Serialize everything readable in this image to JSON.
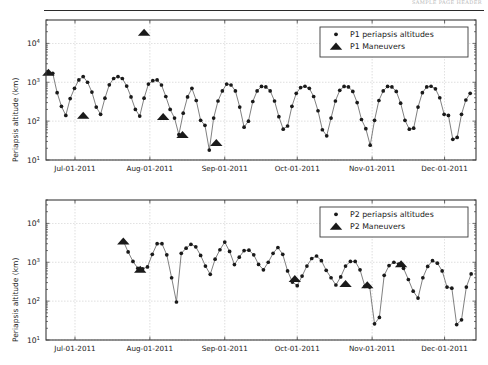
{
  "page": {
    "header_text": "SAMPLE PAGE HEADER",
    "background_color": "#ffffff",
    "marker_color": "#1a1a1a",
    "line_color": "#555555",
    "grid_color": "#c8c8c8",
    "axis_color": "#3a3a3a"
  },
  "chart_data": [
    {
      "type": "line",
      "id": "p1-periapsis-altitudes",
      "title": "",
      "xlabel": "",
      "ylabel": "Periapsis altitude (km)",
      "yscale": "log",
      "ylim": [
        10,
        40000
      ],
      "ytick_labels": [
        "10^1",
        "10^2",
        "10^3",
        "10^4"
      ],
      "ytick_values": [
        10,
        100,
        1000,
        10000
      ],
      "xtick_labels": [
        "Jul-01-2011",
        "Aug-01-2011",
        "Sep-01-2011",
        "Oct-01-2011",
        "Nov-01-2011",
        "Dec-01-2011"
      ],
      "xtick_days": [
        0,
        31,
        62,
        92,
        123,
        153
      ],
      "xlim_days": [
        -12,
        166
      ],
      "grid": true,
      "legend_position": "upper right",
      "legend": [
        {
          "label": "P1 periapsis altitudes",
          "marker": "dot"
        },
        {
          "label": "P1 Maneuvers",
          "marker": "triangle"
        }
      ],
      "series": [
        {
          "name": "P1 periapsis altitudes",
          "marker": "dot",
          "x": [
            -11,
            -9.2,
            -7.4,
            -5.6,
            -3.8,
            -2,
            -0.2,
            1.6,
            3.4,
            5.2,
            7,
            8.8,
            10.6,
            12.4,
            14.2,
            16,
            17.8,
            19.6,
            21.4,
            23.2,
            25,
            26.8,
            28.6,
            30.4,
            32.2,
            34,
            35.8,
            37.6,
            39.4,
            41.2,
            43,
            44.8,
            46.6,
            48.4,
            50.2,
            52,
            53.8,
            55.6,
            57.4,
            59.2,
            61,
            62.8,
            64.6,
            66.4,
            68.2,
            70,
            71.8,
            73.6,
            75.4,
            77.2,
            79,
            80.8,
            82.6,
            84.4,
            86.2,
            88,
            89.8,
            91.6,
            93.4,
            95.2,
            97,
            98.8,
            100.6,
            102.4,
            104.2,
            106,
            107.8,
            109.6,
            111.4,
            113.2,
            115,
            116.8,
            118.6,
            120.4,
            122.2,
            124,
            125.8,
            127.6,
            129.4,
            131.2,
            133,
            134.8,
            136.6,
            138.4,
            140.2,
            142,
            143.8,
            145.6,
            147.4,
            149.2,
            151,
            152.8,
            154.6,
            156.4,
            158.2,
            160,
            161.8,
            163.6
          ],
          "y": [
            1750,
            1700,
            540,
            240,
            140,
            380,
            700,
            1150,
            1400,
            1000,
            560,
            230,
            150,
            390,
            860,
            1250,
            1400,
            1250,
            800,
            420,
            200,
            135,
            390,
            900,
            1100,
            1150,
            850,
            430,
            200,
            120,
            45,
            160,
            420,
            700,
            340,
            105,
            78,
            18,
            120,
            330,
            600,
            900,
            850,
            600,
            230,
            70,
            100,
            320,
            600,
            780,
            760,
            600,
            330,
            130,
            62,
            75,
            240,
            520,
            730,
            790,
            700,
            430,
            185,
            60,
            42,
            120,
            330,
            620,
            780,
            760,
            580,
            300,
            110,
            64,
            24,
            105,
            340,
            600,
            780,
            760,
            580,
            290,
            105,
            62,
            66,
            230,
            540,
            760,
            790,
            680,
            400,
            150,
            140,
            34,
            38,
            150,
            350,
            520
          ]
        }
      ],
      "maneuvers": {
        "name": "P1 Maneuvers",
        "marker": "triangle",
        "x": [
          -11,
          3.4,
          28.6,
          36.5,
          44.5,
          58.5
        ],
        "y": [
          1800,
          140,
          19000,
          130,
          45,
          28
        ]
      }
    },
    {
      "type": "line",
      "id": "p2-periapsis-altitudes",
      "title": "",
      "xlabel": "",
      "ylabel": "Periapsis altitude (km)",
      "yscale": "log",
      "ylim": [
        10,
        40000
      ],
      "ytick_labels": [
        "10^1",
        "10^2",
        "10^3",
        "10^4"
      ],
      "ytick_values": [
        10,
        100,
        1000,
        10000
      ],
      "xtick_labels": [
        "Jul-01-2011",
        "Aug-01-2011",
        "Sep-01-2011",
        "Oct-01-2011",
        "Nov-01-2011",
        "Dec-01-2011"
      ],
      "xtick_days": [
        0,
        31,
        62,
        92,
        123,
        153
      ],
      "xlim_days": [
        -12,
        166
      ],
      "grid": true,
      "legend_position": "upper right",
      "legend": [
        {
          "label": "P2 periapsis altitudes",
          "marker": "dot"
        },
        {
          "label": "P2 Maneuvers",
          "marker": "triangle"
        }
      ],
      "series": [
        {
          "name": "P2 periapsis altitudes",
          "marker": "dot",
          "x": [
            20,
            22,
            24,
            26,
            28,
            30,
            32,
            34,
            36,
            38,
            40,
            42,
            44,
            46,
            48,
            50,
            52,
            54,
            56,
            58,
            60,
            62,
            64,
            66,
            68,
            70,
            72,
            74,
            76,
            78,
            80,
            82,
            84,
            86,
            88,
            90,
            92,
            94,
            96,
            98,
            100,
            102,
            104,
            106,
            108,
            110,
            112,
            114,
            116,
            118,
            120,
            122,
            124,
            126,
            128,
            130,
            132,
            134,
            136,
            138,
            140,
            142,
            144,
            146,
            148,
            150,
            152,
            154,
            156,
            158,
            160,
            162,
            164
          ],
          "y": [
            3500,
            1850,
            1050,
            700,
            680,
            760,
            1600,
            3000,
            3000,
            1550,
            400,
            95,
            1700,
            2300,
            2900,
            2500,
            1500,
            800,
            490,
            1200,
            2100,
            3300,
            1900,
            870,
            1350,
            2000,
            2050,
            1550,
            880,
            640,
            1000,
            1700,
            2400,
            1600,
            600,
            310,
            250,
            440,
            800,
            1250,
            1450,
            1100,
            620,
            400,
            260,
            420,
            800,
            1050,
            1050,
            640,
            240,
            230,
            26,
            38,
            460,
            820,
            1000,
            900,
            700,
            360,
            180,
            120,
            400,
            780,
            1100,
            950,
            600,
            230,
            215,
            25,
            33,
            230,
            500
          ]
        }
      ],
      "maneuvers": {
        "name": "P2 Maneuvers",
        "marker": "triangle",
        "x": [
          20,
          27,
          91,
          112,
          121,
          135
        ],
        "y": [
          3500,
          650,
          380,
          280,
          260,
          900
        ]
      }
    }
  ]
}
